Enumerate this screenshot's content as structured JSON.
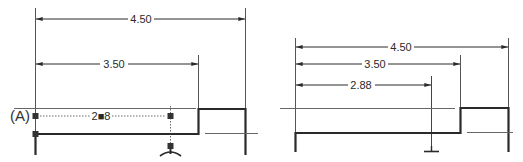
{
  "colors": {
    "line": "#2a2a2a",
    "thin": "#555555",
    "background": "#ffffff"
  },
  "left_view": {
    "datum_label": "(A)",
    "dimensions": [
      {
        "name": "overall-width",
        "value": "4.50"
      },
      {
        "name": "step-position",
        "value": "3.50"
      },
      {
        "name": "feature-position",
        "value": "2■8",
        "state": "being-edited"
      }
    ],
    "icons": [
      "grip-square",
      "grip-square",
      "grip-square",
      "grip-square",
      "surface-symbol"
    ]
  },
  "right_view": {
    "dimensions": [
      {
        "name": "overall-width",
        "value": "4.50"
      },
      {
        "name": "step-position",
        "value": "3.50"
      },
      {
        "name": "feature-position",
        "value": "2.88"
      }
    ],
    "icons": [
      "surface-symbol"
    ]
  }
}
